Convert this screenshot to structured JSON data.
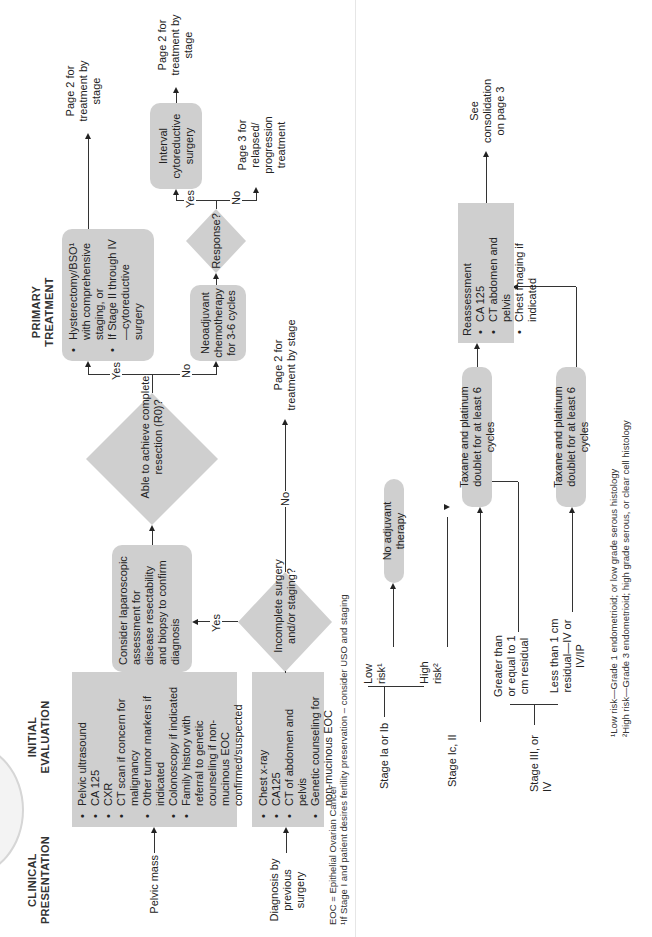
{
  "headers": {
    "clinical_presentation": "CLINICAL PRESENTATION",
    "initial_evaluation": "INITIAL EVALUATION",
    "primary_treatment": "PRIMARY TREATMENT"
  },
  "presentations": {
    "pelvic_mass": "Pelvic mass",
    "diagnosis_previous_surgery": "Diagnosis by previous surgery"
  },
  "initial_eval_box": {
    "items": [
      "Pelvic ultrasound",
      "CA 125",
      "CXR",
      "CT scan if concern for malignancy",
      "Other tumor markers if indicated",
      "Colonoscopy if indicated",
      "Family history with referral to genetic counseling if non-mucinous EOC confirmed/suspected"
    ]
  },
  "previous_surgery_box": {
    "items": [
      "Chest x-ray",
      "CA125",
      "CT of abdomen and pelvis",
      "Genetic counseling for non-mucinous EOC"
    ]
  },
  "laparoscopic_box": "Consider laparoscopic assessment for disease resectability and biopsy to confirm diagnosis",
  "decision_r0": "Able to achieve complete resection (R0)?",
  "decision_incomplete": "Incomplete surgery and/or staging?",
  "decision_response": "Response?",
  "hysterectomy_box": {
    "items": [
      "Hysterectomy/BSO¹ with comprehensive staging, or",
      "If Stage II through IV—cytoreductive surgery"
    ]
  },
  "neoadjuvant_box": "Neoadjuvant chemotherapy for 3-6 cycles",
  "interval_box": "Interval cytoreductive surgery",
  "outcomes": {
    "page2_hyst": "Page 2 for treatment by stage",
    "page2_interval": "Page 2 for treatment by stage",
    "page3_relapsed": "Page 3 for relapsed/ progression treatment",
    "page2_incomplete": "Page 2 for treatment by stage",
    "see_consolidation": "See consolidation on page 3"
  },
  "labels": {
    "yes": "Yes",
    "no": "No"
  },
  "stages": {
    "stage_1ab": "Stage Ia or Ib",
    "stage_1c_2": "Stage Ic, II",
    "stage_3_4": "Stage III, or IV",
    "low_risk": "Low risk¹",
    "high_risk": "High risk²",
    "ge_1cm": "Greater than or equal to 1 cm residual",
    "lt_1cm": "Less than 1 cm residual—IV or IV/IP"
  },
  "treatments": {
    "no_adjuvant": "No adjuvant therapy",
    "taxane_1": "Taxane and platinum doublet for at least 6 cycles",
    "taxane_2": "Taxane and platinum doublet for at least 6 cycles"
  },
  "reassessment_box": {
    "title": "Reassessment",
    "items": [
      "CA 125",
      "CT abdomen and pelvis",
      "Chest imaging if indicated"
    ]
  },
  "footnotes": {
    "eoc": "EOC = Epithelial Ovarian Cancer",
    "fn1": "¹If Stage I and patient desires fertility preservation – consider USO and staging",
    "low_risk_def": "¹Low risk—Grade 1 endometrioid;  or low grade serous histology",
    "high_risk_def": "²High risk—Grade 3  endometrioid; high grade serous, or clear cell histology"
  },
  "colors": {
    "box_fill": "#cfcfcf",
    "line": "#333333",
    "background": "#ffffff"
  }
}
